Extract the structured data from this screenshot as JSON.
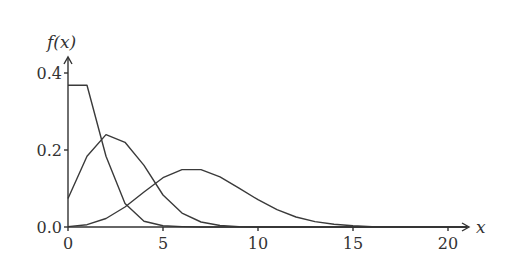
{
  "chart_data": {
    "type": "line",
    "title": "",
    "xlabel": "x",
    "ylabel": "f(x)",
    "xlim": [
      0,
      21
    ],
    "ylim": [
      0,
      0.42
    ],
    "grid": false,
    "legend": null,
    "x_ticks": [
      0,
      5,
      10,
      15,
      20
    ],
    "x_tick_labels": [
      "0",
      "5",
      "10",
      "15",
      "20"
    ],
    "y_ticks": [
      0.0,
      0.2,
      0.4
    ],
    "y_tick_labels": [
      "0.0",
      "0.2",
      "0.4"
    ],
    "x": [
      0,
      1,
      2,
      3,
      4,
      5,
      6,
      7,
      8,
      9,
      10,
      11,
      12,
      13,
      14,
      15,
      16,
      17,
      18,
      19,
      20,
      21
    ],
    "series": [
      {
        "name": "lambda=1",
        "values": [
          0.368,
          0.368,
          0.184,
          0.061,
          0.015,
          0.003,
          0.001,
          0,
          0,
          0,
          0,
          0,
          0,
          0,
          0,
          0,
          0,
          0,
          0,
          0,
          0,
          0
        ]
      },
      {
        "name": "lambda~2.6",
        "values": [
          0.074,
          0.184,
          0.24,
          0.22,
          0.16,
          0.083,
          0.036,
          0.013,
          0.004,
          0.001,
          0,
          0,
          0,
          0,
          0,
          0,
          0,
          0,
          0,
          0,
          0,
          0
        ]
      },
      {
        "name": "lambda=7",
        "values": [
          0.001,
          0.006,
          0.022,
          0.052,
          0.091,
          0.128,
          0.149,
          0.149,
          0.13,
          0.101,
          0.071,
          0.045,
          0.026,
          0.014,
          0.007,
          0.003,
          0.001,
          0.001,
          0,
          0,
          0,
          0
        ]
      }
    ]
  }
}
